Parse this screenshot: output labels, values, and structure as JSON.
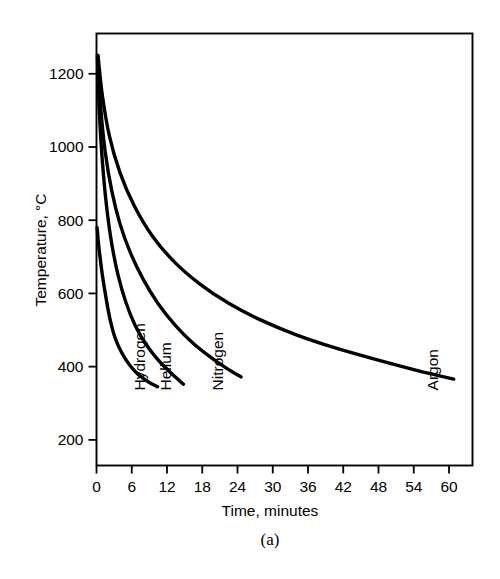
{
  "figure": {
    "caption": "(a)",
    "background_color": "#ffffff",
    "ink_color": "#000000"
  },
  "chart_data": {
    "type": "line",
    "title": "",
    "xlabel": "Time, minutes",
    "ylabel": "Temperature, °C",
    "xlim": [
      0,
      64
    ],
    "ylim": [
      130,
      1310
    ],
    "grid": false,
    "legend_position": "inline-curve-labels",
    "xticks": [
      0,
      6,
      12,
      18,
      24,
      30,
      36,
      42,
      48,
      54,
      60
    ],
    "xtick_labels": [
      "0",
      "6",
      "12",
      "18",
      "24",
      "30",
      "36",
      "42",
      "48",
      "54",
      "60"
    ],
    "yticks": [
      200,
      400,
      600,
      800,
      1000,
      1200
    ],
    "ytick_labels": [
      "200",
      "400",
      "600",
      "800",
      "1000",
      "1200"
    ],
    "series": [
      {
        "name": "Hydrogen",
        "x": [
          0.1,
          0.3,
          0.6,
          1.0,
          1.6,
          2.3,
          3.2,
          4.3,
          5.6,
          7.0,
          8.5,
          9.6,
          10.4
        ],
        "y": [
          780,
          742,
          700,
          650,
          590,
          530,
          477,
          438,
          405,
          380,
          362,
          351,
          345
        ]
      },
      {
        "name": "Helium",
        "x": [
          0.15,
          0.5,
          1.0,
          1.7,
          2.6,
          3.7,
          5.0,
          6.6,
          8.4,
          10.3,
          12.2,
          13.8,
          14.8
        ],
        "y": [
          1250,
          1090,
          960,
          840,
          735,
          648,
          576,
          512,
          462,
          422,
          390,
          366,
          352
        ]
      },
      {
        "name": "Nitrogen",
        "x": [
          0.2,
          0.7,
          1.5,
          2.6,
          4.0,
          5.8,
          8.0,
          10.5,
          13.3,
          16.3,
          19.4,
          22.3,
          24.6
        ],
        "y": [
          1250,
          1110,
          985,
          880,
          790,
          710,
          637,
          572,
          515,
          466,
          426,
          394,
          372
        ]
      },
      {
        "name": "Argon",
        "x": [
          0.25,
          1.0,
          2.2,
          4.0,
          6.4,
          9.5,
          13.2,
          17.5,
          22.5,
          28.0,
          34.0,
          40.5,
          47.5,
          54.5,
          60.8
        ],
        "y": [
          1250,
          1140,
          1030,
          930,
          840,
          757,
          687,
          627,
          573,
          527,
          487,
          452,
          420,
          390,
          366
        ]
      }
    ],
    "series_labels": [
      {
        "text": "Hydrogen",
        "x_min": 8.2,
        "temp_anchor": 335,
        "rotation": -90
      },
      {
        "text": "Helium",
        "x_min": 12.6,
        "temp_anchor": 335,
        "rotation": -90
      },
      {
        "text": "Nitrogen",
        "x_min": 21.6,
        "temp_anchor": 335,
        "rotation": -90
      },
      {
        "text": "Argon",
        "x_min": 58.2,
        "temp_anchor": 335,
        "rotation": -90
      }
    ]
  }
}
